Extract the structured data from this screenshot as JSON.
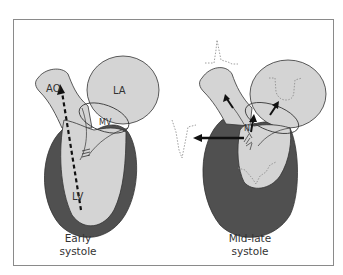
{
  "figure": {
    "panels": [
      {
        "id": "early-systole",
        "caption_line1": "Early",
        "caption_line2": "systole",
        "labels": {
          "aorta": "AO",
          "left_atrium": "LA",
          "mitral_valve": "MV",
          "left_ventricle": "LV"
        }
      },
      {
        "id": "mid-late-systole",
        "caption_line1": "Mid-late",
        "caption_line2": "systole",
        "labels": {
          "septal_label": "N"
        }
      }
    ],
    "colors": {
      "frame": "#8a8a8a",
      "chamber_fill": "#d4d4d4",
      "myocardium": "#505050",
      "outline": "#333333",
      "arrow": "#111111",
      "trace": "#888888"
    }
  }
}
